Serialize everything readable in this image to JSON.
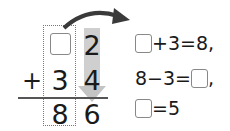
{
  "vertical_addition": {
    "top_row": {
      "tens": "",
      "ones": "2"
    },
    "middle_row": {
      "operator": "+",
      "tens": "3",
      "ones": "4"
    },
    "result_row": {
      "tens": "8",
      "ones": "6"
    }
  },
  "equations": [
    {
      "before": "",
      "after": "+3=8,"
    },
    {
      "before": "8−3=",
      "after": ","
    },
    {
      "before": "",
      "after": "=5"
    }
  ],
  "colors": {
    "gray_column": "#cfcfcf",
    "arrow": "#3a3a3a",
    "box_border": "#888888"
  }
}
